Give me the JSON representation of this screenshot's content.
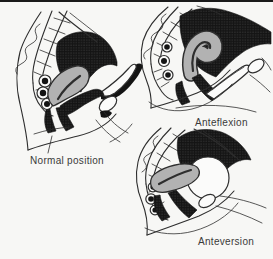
{
  "figures": [
    {
      "id": "normal-position",
      "label": "Normal position"
    },
    {
      "id": "anteflexion",
      "label": "Anteflexion"
    },
    {
      "id": "anteversion",
      "label": "Anteversion"
    }
  ],
  "colors": {
    "paper": "#f7f7f5",
    "line": "#2e2e2e",
    "uterus_gray": "#b2b2b2",
    "dark_mass": "#141414",
    "stipple_dot": "#4d4d4d",
    "label_color": "#3a3a3a",
    "rule_color": "#1a1a1a"
  }
}
